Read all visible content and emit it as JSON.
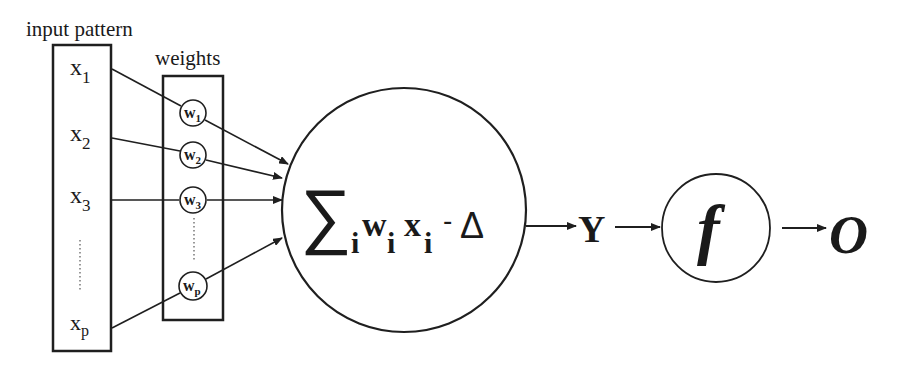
{
  "labels": {
    "input_pattern": "input pattern",
    "weights": "weights"
  },
  "inputs": [
    {
      "base": "x",
      "sub": "1"
    },
    {
      "base": "x",
      "sub": "2"
    },
    {
      "base": "x",
      "sub": "3"
    },
    {
      "base": "x",
      "sub": "p"
    }
  ],
  "weights": [
    {
      "base": "w",
      "sub": "1"
    },
    {
      "base": "w",
      "sub": "2"
    },
    {
      "base": "w",
      "sub": "3"
    },
    {
      "base": "w",
      "sub": "p"
    }
  ],
  "summation": {
    "sigma": "∑",
    "sigma_sub": "i",
    "w": "w",
    "w_sub": "i",
    "x": "x",
    "x_sub": "i",
    "minus": "-",
    "threshold": "Δ"
  },
  "net_output": "Y",
  "activation": "f",
  "output": "O",
  "colors": {
    "line": "#1f1f1f",
    "background": "#ffffff"
  }
}
